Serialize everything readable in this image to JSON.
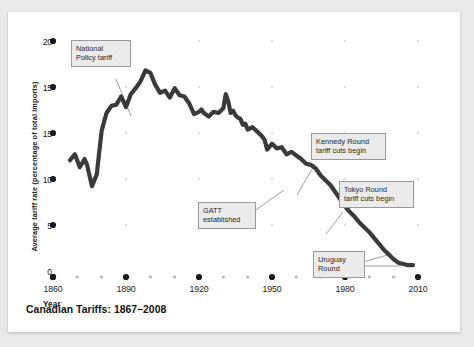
{
  "figure": {
    "title": "Canadian Tariffs: 1867–2008",
    "background_color": "#e9e9e9",
    "card_color": "#ffffff",
    "line_color": "#3a3a3a",
    "annotation_fill": "#ebebeb",
    "annotation_border": "#9a9a9a"
  },
  "axes": {
    "y_axis_label": "Average tariff rate (percentage of total imports)",
    "x_axis_label": "Year",
    "y_ticks": [
      "20",
      "15",
      "15",
      "10",
      "5",
      "0"
    ],
    "x_ticks": [
      "1860",
      "1890",
      "1920",
      "1950",
      "1980",
      "2010"
    ]
  },
  "annotations": [
    {
      "id": "national-policy",
      "text": "National\nPolicy tariff"
    },
    {
      "id": "gatt",
      "text": "GATT\nestablished"
    },
    {
      "id": "kennedy-round",
      "text": "Kennedy Round\ntariff cuts begin"
    },
    {
      "id": "tokyo-round",
      "text": "Tokyo Round\ntariff cuts begin"
    },
    {
      "id": "uruguay-round",
      "text": "Uruguay\nRound"
    }
  ],
  "chart_data": {
    "type": "line",
    "title": "Canadian Tariffs: 1867–2008",
    "xlabel": "Year",
    "ylabel": "Average tariff rate (percentage of total imports)",
    "xlim": [
      1860,
      2010
    ],
    "ylim": [
      0,
      20
    ],
    "y_tick_values": [
      20,
      15,
      15,
      10,
      5,
      0
    ],
    "y_tick_labels": [
      "20",
      "15",
      "15",
      "10",
      "5",
      "0"
    ],
    "x_tick_values": [
      1860,
      1890,
      1920,
      1950,
      1980,
      2010
    ],
    "x_tick_labels": [
      "1860",
      "1890",
      "1920",
      "1950",
      "1980",
      "2010"
    ],
    "x_minor_tick_values": [
      1870,
      1880,
      1900,
      1910,
      1930,
      1940,
      1960,
      1970,
      1990,
      2000
    ],
    "grid": false,
    "legend": null,
    "series": [
      {
        "name": "Average tariff rate",
        "color": "#3a3a3a",
        "x": [
          1867,
          1869,
          1871,
          1873,
          1874,
          1876,
          1878,
          1879,
          1880,
          1882,
          1884,
          1886,
          1888,
          1890,
          1892,
          1894,
          1896,
          1898,
          1900,
          1902,
          1904,
          1906,
          1908,
          1910,
          1912,
          1914,
          1916,
          1918,
          1920,
          1921,
          1922,
          1924,
          1926,
          1928,
          1930,
          1931,
          1932,
          1933,
          1934,
          1935,
          1936,
          1937,
          1938,
          1939,
          1940,
          1942,
          1944,
          1946,
          1947,
          1948,
          1950,
          1952,
          1954,
          1956,
          1958,
          1960,
          1962,
          1964,
          1966,
          1968,
          1970,
          1972,
          1974,
          1976,
          1978,
          1980,
          1982,
          1984,
          1986,
          1988,
          1990,
          1992,
          1994,
          1996,
          1998,
          2000,
          2002,
          2004,
          2006,
          2008
        ],
        "y": [
          9.9,
          10.4,
          9.3,
          10.0,
          9.5,
          7.7,
          8.7,
          10.6,
          12.4,
          13.9,
          14.5,
          14.6,
          15.3,
          14.4,
          15.5,
          16.0,
          16.6,
          17.5,
          17.3,
          16.3,
          15.6,
          15.8,
          15.2,
          16.0,
          15.4,
          15.3,
          14.7,
          13.8,
          14.0,
          14.2,
          13.9,
          13.6,
          14.0,
          13.9,
          14.3,
          15.5,
          14.9,
          13.9,
          14.1,
          13.7,
          13.5,
          13.4,
          12.9,
          13.0,
          12.5,
          12.7,
          12.3,
          11.9,
          11.6,
          10.8,
          11.3,
          10.9,
          11.0,
          10.4,
          10.6,
          10.3,
          10.0,
          9.6,
          9.5,
          9.2,
          8.6,
          8.2,
          7.8,
          7.2,
          6.6,
          6.0,
          5.5,
          5.1,
          4.6,
          4.2,
          3.8,
          3.3,
          2.8,
          2.3,
          1.9,
          1.5,
          1.2,
          1.1,
          1.0,
          1.0
        ]
      }
    ]
  }
}
